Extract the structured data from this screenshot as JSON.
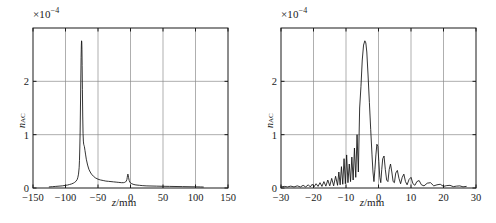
{
  "figure": {
    "background": "#ffffff",
    "line_color": "#101010",
    "grid_color": "#8c8c8c",
    "frame_color": "#1a1a1a"
  },
  "panels": [
    {
      "id": "left",
      "multiplier_label": "×10",
      "multiplier_exponent": "−4",
      "ylabel_main": "n",
      "ylabel_sub": "AC",
      "xlabel_var": "z",
      "xlabel_unit": "/mm",
      "xticks": [
        "−150",
        "−100",
        "−50",
        "0",
        "50",
        "100",
        "150"
      ],
      "yticks": [
        "0",
        "1",
        "2"
      ]
    },
    {
      "id": "right",
      "multiplier_label": "×10",
      "multiplier_exponent": "−4",
      "ylabel_main": "n",
      "ylabel_sub": "AC",
      "xlabel_var": "z",
      "xlabel_unit": "/mm",
      "xticks": [
        "−30",
        "−20",
        "−10",
        "0",
        "10",
        "20",
        "30"
      ],
      "yticks": [
        "0",
        "1",
        "2"
      ]
    }
  ],
  "chart_data": [
    {
      "type": "line",
      "panel": "left",
      "title": "",
      "xlabel": "z/mm",
      "ylabel": "n_AC",
      "y_multiplier": 0.0001,
      "xlim": [
        -150,
        150
      ],
      "ylim": [
        0,
        3
      ],
      "xticks": [
        -150,
        -100,
        -50,
        0,
        50,
        100,
        150
      ],
      "yticks": [
        0,
        1,
        2
      ],
      "grid": true,
      "legend": null,
      "series": [
        {
          "name": "n_AC",
          "x": [
            -125,
            -120,
            -115,
            -110,
            -105,
            -100,
            -97,
            -94,
            -91,
            -88,
            -86,
            -84,
            -82,
            -81,
            -80,
            -79,
            -78.5,
            -78,
            -77.5,
            -77,
            -76.5,
            -76,
            -75.6,
            -75.3,
            -75,
            -74.7,
            -74.4,
            -74,
            -73.5,
            -73,
            -72.5,
            -72,
            -71.5,
            -71,
            -70,
            -69,
            -68,
            -66,
            -64,
            -62,
            -60,
            -57,
            -54,
            -50,
            -46,
            -42,
            -38,
            -34,
            -30,
            -26,
            -22,
            -18,
            -14,
            -11,
            -9,
            -7.5,
            -6.5,
            -5.5,
            -5,
            -4.5,
            -4,
            -3.5,
            -3,
            -2,
            -1,
            0,
            2,
            4,
            7,
            10,
            14,
            18,
            24,
            30,
            40,
            50,
            60,
            70,
            80,
            90,
            100,
            108,
            112
          ],
          "y": [
            0.02,
            0.025,
            0.03,
            0.035,
            0.04,
            0.05,
            0.055,
            0.065,
            0.075,
            0.09,
            0.105,
            0.125,
            0.16,
            0.2,
            0.26,
            0.38,
            0.52,
            0.75,
            1.05,
            1.5,
            2.0,
            2.45,
            2.68,
            2.76,
            2.74,
            2.6,
            2.3,
            1.85,
            1.35,
            1.02,
            0.88,
            0.82,
            0.8,
            0.78,
            0.7,
            0.62,
            0.54,
            0.43,
            0.35,
            0.3,
            0.26,
            0.22,
            0.19,
            0.165,
            0.15,
            0.14,
            0.13,
            0.125,
            0.12,
            0.115,
            0.11,
            0.105,
            0.1,
            0.1,
            0.105,
            0.115,
            0.13,
            0.16,
            0.2,
            0.24,
            0.26,
            0.24,
            0.2,
            0.14,
            0.11,
            0.095,
            0.08,
            0.07,
            0.06,
            0.055,
            0.05,
            0.045,
            0.04,
            0.038,
            0.035,
            0.032,
            0.03,
            0.028,
            0.026,
            0.024,
            0.022,
            0.02,
            0.018
          ]
        }
      ]
    },
    {
      "type": "line",
      "panel": "right",
      "title": "",
      "xlabel": "z/mm",
      "ylabel": "n_AC",
      "y_multiplier": 0.0001,
      "xlim": [
        -30,
        30
      ],
      "ylim": [
        0,
        3
      ],
      "xticks": [
        -30,
        -20,
        -10,
        0,
        10,
        20,
        30
      ],
      "yticks": [
        0,
        1,
        2
      ],
      "grid": true,
      "legend": null,
      "series": [
        {
          "name": "n_AC",
          "x": [
            -30,
            -29,
            -28,
            -27,
            -26,
            -25,
            -24,
            -23.2,
            -22.4,
            -21.6,
            -21,
            -20.4,
            -19.8,
            -19.2,
            -18.6,
            -18,
            -17.4,
            -16.8,
            -16.2,
            -15.6,
            -15,
            -14.4,
            -13.8,
            -13.2,
            -12.6,
            -12.2,
            -11.8,
            -11.4,
            -11,
            -10.6,
            -10.2,
            -9.8,
            -9.4,
            -9,
            -8.6,
            -8.2,
            -7.8,
            -7.4,
            -7,
            -6.6,
            -6.2,
            -5.8,
            -5.4,
            -5,
            -4.6,
            -4.2,
            -3.9,
            -3.6,
            -3.2,
            -2.8,
            -2.4,
            -2,
            -1.7,
            -1.4,
            -1.1,
            -0.8,
            -0.5,
            -0.2,
            0.1,
            0.4,
            0.7,
            1,
            1.3,
            1.7,
            2.1,
            2.5,
            2.9,
            3.3,
            3.7,
            4.1,
            4.5,
            4.9,
            5.3,
            5.8,
            6.3,
            6.8,
            7.3,
            7.8,
            8.3,
            8.8,
            9.4,
            10,
            10.6,
            11.2,
            11.8,
            12.5,
            13.2,
            14,
            15,
            16,
            17,
            18,
            19,
            20,
            21,
            22,
            23,
            24,
            25,
            26,
            27
          ],
          "y": [
            0.02,
            0.03,
            0.02,
            0.035,
            0.02,
            0.04,
            0.02,
            0.05,
            0.02,
            0.06,
            0.02,
            0.07,
            0.025,
            0.08,
            0.03,
            0.1,
            0.03,
            0.12,
            0.035,
            0.15,
            0.04,
            0.18,
            0.04,
            0.22,
            0.05,
            0.3,
            0.06,
            0.4,
            0.07,
            0.55,
            0.08,
            0.62,
            0.1,
            0.45,
            0.12,
            0.58,
            0.15,
            0.75,
            0.2,
            1.0,
            0.3,
            1.5,
            1.9,
            2.4,
            2.68,
            2.76,
            2.72,
            2.55,
            2.1,
            1.6,
            1.1,
            0.62,
            0.3,
            0.12,
            0.35,
            0.62,
            0.82,
            0.78,
            0.5,
            0.2,
            0.1,
            0.35,
            0.55,
            0.6,
            0.35,
            0.15,
            0.12,
            0.35,
            0.45,
            0.3,
            0.12,
            0.1,
            0.28,
            0.33,
            0.18,
            0.08,
            0.2,
            0.26,
            0.12,
            0.06,
            0.16,
            0.2,
            0.08,
            0.05,
            0.12,
            0.14,
            0.06,
            0.04,
            0.09,
            0.1,
            0.04,
            0.06,
            0.07,
            0.03,
            0.045,
            0.05,
            0.025,
            0.035,
            0.04,
            0.022,
            0.03,
            0.03,
            0.02
          ]
        }
      ]
    }
  ]
}
